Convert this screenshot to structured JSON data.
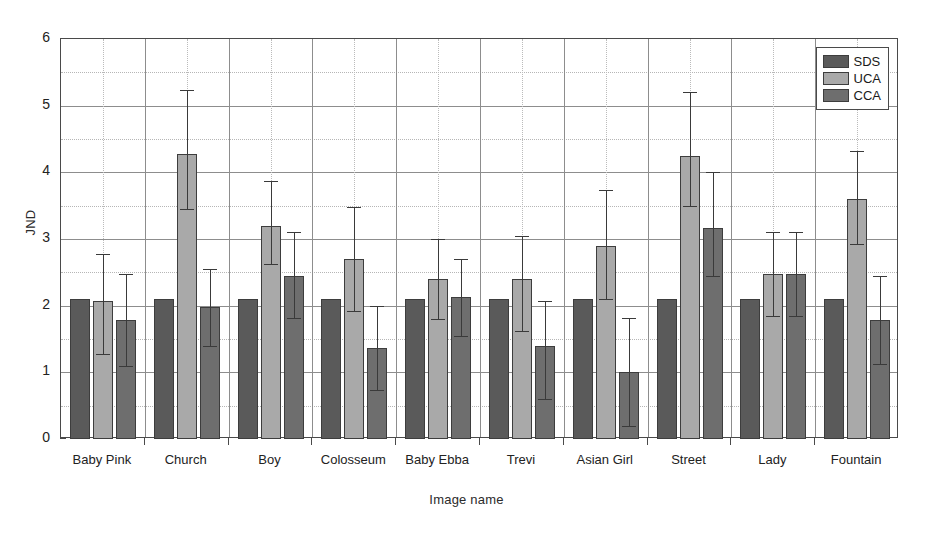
{
  "chart_data": {
    "type": "bar",
    "title": "",
    "xlabel": "Image name",
    "ylabel": "JND",
    "ylim": [
      0,
      6
    ],
    "ytick_values": [
      0,
      1,
      2,
      3,
      4,
      5,
      6
    ],
    "ytick_labels": [
      "0",
      "1",
      "2",
      "3",
      "4",
      "5",
      "6"
    ],
    "minor_gridlines_y": [
      0.5,
      1.5,
      2.5,
      3.5,
      4.5,
      5.5
    ],
    "grid": true,
    "legend_position": "top-right",
    "categories": [
      "Baby Pink",
      "Church",
      "Boy",
      "Colosseum",
      "Baby Ebba",
      "Trevi",
      "Asian Girl",
      "Street",
      "Lady",
      "Fountain"
    ],
    "series": [
      {
        "name": "SDS",
        "color": "#5a5a5a",
        "values": [
          2.1,
          2.1,
          2.1,
          2.1,
          2.1,
          2.1,
          2.1,
          2.1,
          2.1,
          2.1
        ],
        "err_low": [
          null,
          null,
          null,
          null,
          null,
          null,
          null,
          null,
          null,
          null
        ],
        "err_high": [
          null,
          null,
          null,
          null,
          null,
          null,
          null,
          null,
          null,
          null
        ]
      },
      {
        "name": "UCA",
        "color": "#a9a9a9",
        "values": [
          2.07,
          4.27,
          3.2,
          2.7,
          2.4,
          2.4,
          2.9,
          4.25,
          2.47,
          3.6
        ],
        "err_low": [
          1.28,
          3.45,
          2.63,
          1.92,
          1.8,
          1.62,
          2.1,
          3.5,
          1.85,
          2.93
        ],
        "err_high": [
          2.78,
          5.23,
          3.87,
          3.48,
          3.0,
          3.05,
          3.73,
          5.2,
          3.1,
          4.32
        ]
      },
      {
        "name": "CCA",
        "color": "#6e6e6e",
        "values": [
          1.78,
          1.98,
          2.45,
          1.37,
          2.13,
          1.4,
          1.0,
          3.17,
          2.47,
          1.78
        ],
        "err_low": [
          1.1,
          1.4,
          1.82,
          0.73,
          1.55,
          0.6,
          0.2,
          2.45,
          1.85,
          1.13
        ],
        "err_high": [
          2.47,
          2.55,
          3.1,
          2.0,
          2.7,
          2.07,
          1.82,
          4.0,
          3.1,
          2.45
        ]
      }
    ]
  },
  "legend": {
    "entries": [
      {
        "label": "SDS",
        "color": "#5a5a5a"
      },
      {
        "label": "UCA",
        "color": "#a9a9a9"
      },
      {
        "label": "CCA",
        "color": "#6e6e6e"
      }
    ]
  }
}
